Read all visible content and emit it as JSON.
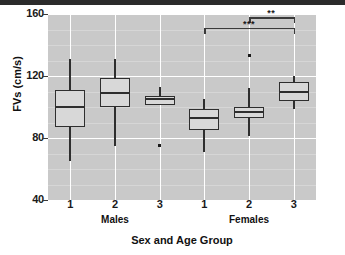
{
  "figure": {
    "top_rule_color": "#2b2b2b",
    "plot_bg_color": "#c9c9c9",
    "grid_color": "#ffffff",
    "box_fill_color": "#d8d8d8",
    "line_color": "#2e2e2e"
  },
  "chart_data": {
    "type": "box",
    "title": "",
    "xlabel": "Sex and Age Group",
    "ylabel": "FVs (cm/s)",
    "ylim": [
      40,
      160
    ],
    "yticks": [
      40,
      80,
      120,
      160
    ],
    "ytick_labels": [
      "40",
      "80",
      "120",
      "160"
    ],
    "grid": true,
    "legend": "none",
    "categories": [
      "1",
      "2",
      "3",
      "1",
      "2",
      "3"
    ],
    "group_labels": [
      "Males",
      "Females"
    ],
    "group_spans": [
      [
        0,
        2
      ],
      [
        3,
        5
      ]
    ],
    "boxes": [
      {
        "label": "1",
        "group": "Males",
        "whisker_low": 65,
        "q1": 87,
        "median": 100,
        "q3": 111,
        "whisker_high": 131,
        "outliers": []
      },
      {
        "label": "2",
        "group": "Males",
        "whisker_low": 75,
        "q1": 100,
        "median": 109,
        "q3": 119,
        "whisker_high": 131,
        "outliers": []
      },
      {
        "label": "3",
        "group": "Males",
        "whisker_low": 101,
        "q1": 101,
        "median": 105,
        "q3": 107,
        "whisker_high": 113,
        "outliers": [
          75
        ]
      },
      {
        "label": "1",
        "group": "Females",
        "whisker_low": 71,
        "q1": 85,
        "median": 93,
        "q3": 99,
        "whisker_high": 105,
        "outliers": []
      },
      {
        "label": "2",
        "group": "Females",
        "whisker_low": 81,
        "q1": 93,
        "median": 97,
        "q3": 100,
        "whisker_high": 112,
        "outliers": [
          133
        ]
      },
      {
        "label": "3",
        "group": "Females",
        "whisker_low": 99,
        "q1": 104,
        "median": 110,
        "q3": 116,
        "whisker_high": 120,
        "outliers": []
      }
    ],
    "annotations": [
      {
        "name": "significance-bracket-upper",
        "stars": "**",
        "from_box": 4,
        "to_box": 5,
        "y": 158
      },
      {
        "name": "significance-bracket-lower",
        "stars": "***",
        "from_box": 3,
        "to_box": 5,
        "y": 151
      }
    ]
  }
}
